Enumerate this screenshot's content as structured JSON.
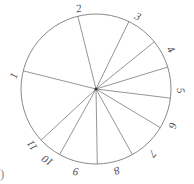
{
  "figure": {
    "kind": "hand-drawn-pie-chart",
    "stroke_color": "#7a7a7a",
    "label_color": "#4a4a4a",
    "background": "#ffffff",
    "corner_mark": ")"
  },
  "chart_data": {
    "type": "pie",
    "title": "",
    "xlabel": "",
    "ylabel": "",
    "legend": "none",
    "grid": false,
    "center": {
      "x": 96,
      "y": 89
    },
    "radius": 75,
    "start_angle_deg": 104,
    "direction": "clockwise",
    "labels": [
      "1",
      "2",
      "3",
      "4",
      "5",
      "6",
      "7",
      "8",
      "9",
      "10",
      "11"
    ],
    "categories": [
      "1",
      "2",
      "3",
      "4",
      "5",
      "6",
      "7",
      "8",
      "9",
      "10",
      "11"
    ],
    "values": [
      62,
      40,
      25,
      22,
      24,
      24,
      30,
      28,
      30,
      18,
      57
    ],
    "slices": [
      {
        "label": "1",
        "start_deg": 104,
        "end_deg": 166,
        "label_pos": {
          "x": 11,
          "y": 70
        },
        "label_rot": -72
      },
      {
        "label": "2",
        "start_deg": 64,
        "end_deg": 104,
        "label_pos": {
          "x": 76,
          "y": 3
        },
        "label_rot": -12
      },
      {
        "label": "3",
        "start_deg": 39,
        "end_deg": 64,
        "label_pos": {
          "x": 135,
          "y": 11
        },
        "label_rot": 28
      },
      {
        "label": "4",
        "start_deg": 17,
        "end_deg": 39,
        "label_pos": {
          "x": 168,
          "y": 44
        },
        "label_rot": 55
      },
      {
        "label": "5",
        "start_deg": -7,
        "end_deg": 17,
        "label_pos": {
          "x": 178,
          "y": 85
        },
        "label_rot": 80
      },
      {
        "label": "6",
        "start_deg": -31,
        "end_deg": -7,
        "label_pos": {
          "x": 170,
          "y": 120
        },
        "label_rot": 105
      },
      {
        "label": "7",
        "start_deg": -61,
        "end_deg": -31,
        "label_pos": {
          "x": 150,
          "y": 148
        },
        "label_rot": 130
      },
      {
        "label": "8",
        "start_deg": -89,
        "end_deg": -61,
        "label_pos": {
          "x": 114,
          "y": 165
        },
        "label_rot": 160
      },
      {
        "label": "9",
        "start_deg": -119,
        "end_deg": -89,
        "label_pos": {
          "x": 73,
          "y": 166
        },
        "label_rot": 188
      },
      {
        "label": "10",
        "start_deg": -137,
        "end_deg": -119,
        "label_pos": {
          "x": 42,
          "y": 155
        },
        "label_rot": 215
      },
      {
        "label": "11",
        "start_deg": -194,
        "end_deg": -137,
        "label_pos": {
          "x": 27,
          "y": 140
        },
        "label_rot": 234
      }
    ]
  }
}
